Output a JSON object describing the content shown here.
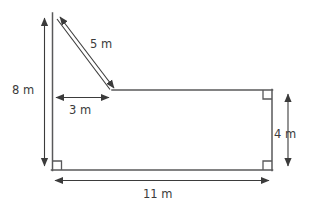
{
  "figure": {
    "type": "geometry-diagram",
    "background_color": "#ffffff",
    "shape_stroke_color": "#58585a",
    "dimension_stroke_color": "#3b3b3b",
    "label_text_color": "#3b3b3b",
    "unit": "m"
  },
  "labels": {
    "vertical_left": "8 m",
    "diagonal": "5 m",
    "horizontal_top": "3 m",
    "vertical_right": "4 m",
    "horizontal_bottom": "11 m"
  },
  "dimensions": [
    {
      "name": "vertical-left",
      "value": 8,
      "unit": "m",
      "text": "8 m",
      "orientation": "vertical",
      "arrow_style": "double-headed"
    },
    {
      "name": "diagonal",
      "value": 5,
      "unit": "m",
      "text": "5 m",
      "orientation": "diagonal",
      "arrow_style": "double-headed"
    },
    {
      "name": "horizontal-top",
      "value": 3,
      "unit": "m",
      "text": "3 m",
      "orientation": "horizontal",
      "arrow_style": "double-headed"
    },
    {
      "name": "vertical-right",
      "value": 4,
      "unit": "m",
      "text": "4 m",
      "orientation": "vertical",
      "arrow_style": "double-headed"
    },
    {
      "name": "horizontal-bottom",
      "value": 11,
      "unit": "m",
      "text": "11 m",
      "orientation": "horizontal",
      "arrow_style": "double-headed"
    }
  ],
  "right_angle_markers": [
    {
      "name": "bottom-left-right-angle",
      "corner": "bottom-left"
    },
    {
      "name": "bottom-right-right-angle",
      "corner": "bottom-right"
    },
    {
      "name": "top-right-right-angle",
      "corner": "top-right"
    }
  ]
}
